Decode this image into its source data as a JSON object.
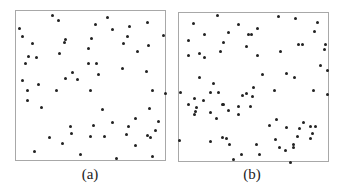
{
  "figure": {
    "panels": [
      {
        "id": "a",
        "caption": "(a)",
        "frame": {
          "x": 15,
          "y": 10,
          "w": 151,
          "h": 151
        },
        "points": [
          [
            52,
            15
          ],
          [
            58,
            20
          ],
          [
            107,
            17
          ],
          [
            95,
            24
          ],
          [
            19,
            28
          ],
          [
            112,
            29
          ],
          [
            129,
            26
          ],
          [
            147,
            22
          ],
          [
            22,
            36
          ],
          [
            91,
            38
          ],
          [
            127,
            36
          ],
          [
            163,
            35
          ],
          [
            65,
            39
          ],
          [
            64,
            42
          ],
          [
            32,
            43
          ],
          [
            123,
            43
          ],
          [
            148,
            45
          ],
          [
            88,
            48
          ],
          [
            59,
            53
          ],
          [
            137,
            51
          ],
          [
            28,
            56
          ],
          [
            36,
            57
          ],
          [
            25,
            63
          ],
          [
            88,
            63
          ],
          [
            96,
            63
          ],
          [
            122,
            68
          ],
          [
            146,
            71
          ],
          [
            72,
            72
          ],
          [
            98,
            74
          ],
          [
            65,
            78
          ],
          [
            77,
            79
          ],
          [
            22,
            80
          ],
          [
            38,
            84
          ],
          [
            27,
            90
          ],
          [
            56,
            90
          ],
          [
            90,
            90
          ],
          [
            152,
            90
          ],
          [
            165,
            93
          ],
          [
            27,
            100
          ],
          [
            41,
            107
          ],
          [
            149,
            108
          ],
          [
            102,
            109
          ],
          [
            135,
            118
          ],
          [
            158,
            121
          ],
          [
            112,
            122
          ],
          [
            70,
            126
          ],
          [
            93,
            125
          ],
          [
            128,
            126
          ],
          [
            155,
            130
          ],
          [
            71,
            133
          ],
          [
            126,
            134
          ],
          [
            49,
            137
          ],
          [
            90,
            136
          ],
          [
            104,
            136
          ],
          [
            147,
            135
          ],
          [
            150,
            137
          ],
          [
            62,
            143
          ],
          [
            135,
            145
          ],
          [
            34,
            151
          ],
          [
            80,
            154
          ],
          [
            152,
            156
          ],
          [
            116,
            158
          ]
        ]
      },
      {
        "id": "b",
        "caption": "(b)",
        "frame": {
          "x": 178,
          "y": 12,
          "w": 151,
          "h": 150
        },
        "points": [
          [
            217,
            15
          ],
          [
            278,
            16
          ],
          [
            295,
            18
          ],
          [
            193,
            23
          ],
          [
            238,
            24
          ],
          [
            317,
            22
          ],
          [
            257,
            28
          ],
          [
            314,
            31
          ],
          [
            228,
            32
          ],
          [
            204,
            34
          ],
          [
            248,
            34
          ],
          [
            251,
            34
          ],
          [
            188,
            40
          ],
          [
            223,
            42
          ],
          [
            298,
            44
          ],
          [
            302,
            44
          ],
          [
            325,
            44
          ],
          [
            246,
            46
          ],
          [
            324,
            49
          ],
          [
            220,
            51
          ],
          [
            280,
            51
          ],
          [
            199,
            53
          ],
          [
            188,
            55
          ],
          [
            204,
            57
          ],
          [
            257,
            55
          ],
          [
            320,
            65
          ],
          [
            327,
            70
          ],
          [
            262,
            74
          ],
          [
            286,
            73
          ],
          [
            294,
            77
          ],
          [
            199,
            77
          ],
          [
            213,
            83
          ],
          [
            253,
            87
          ],
          [
            180,
            92
          ],
          [
            210,
            92
          ],
          [
            218,
            92
          ],
          [
            274,
            90
          ],
          [
            313,
            90
          ],
          [
            327,
            94
          ],
          [
            246,
            93
          ],
          [
            242,
            95
          ],
          [
            252,
            96
          ],
          [
            194,
            98
          ],
          [
            203,
            100
          ],
          [
            188,
            104
          ],
          [
            222,
            104
          ],
          [
            223,
            104
          ],
          [
            196,
            107
          ],
          [
            238,
            106
          ],
          [
            250,
            106
          ],
          [
            195,
            111
          ],
          [
            210,
            112
          ],
          [
            228,
            110
          ],
          [
            194,
            114
          ],
          [
            238,
            114
          ],
          [
            216,
            118
          ],
          [
            276,
            119
          ],
          [
            269,
            125
          ],
          [
            303,
            122
          ],
          [
            286,
            127
          ],
          [
            299,
            128
          ],
          [
            310,
            126
          ],
          [
            315,
            126
          ],
          [
            312,
            133
          ],
          [
            297,
            136
          ],
          [
            179,
            140
          ],
          [
            210,
            141
          ],
          [
            222,
            137
          ],
          [
            226,
            138
          ],
          [
            275,
            139
          ],
          [
            310,
            138
          ],
          [
            229,
            144
          ],
          [
            256,
            144
          ],
          [
            293,
            144
          ],
          [
            279,
            147
          ],
          [
            293,
            147
          ],
          [
            285,
            150
          ],
          [
            241,
            154
          ],
          [
            259,
            154
          ],
          [
            233,
            159
          ],
          [
            290,
            162
          ]
        ]
      }
    ],
    "colors": {
      "frame": "#a8a8a8",
      "dot": "#222222",
      "text": "#222222"
    }
  }
}
